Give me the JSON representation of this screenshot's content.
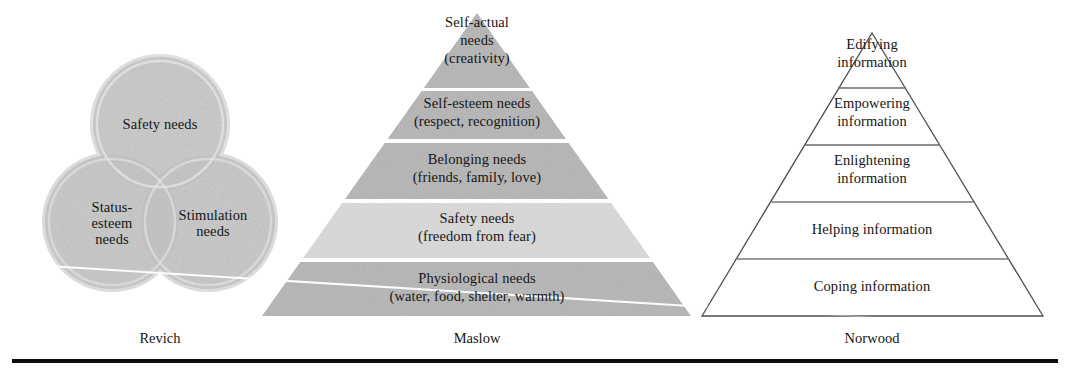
{
  "figure": {
    "background_color": "#ffffff",
    "rule_color": "#0d0d0d",
    "text_color": "#161616"
  },
  "colors": {
    "band_dark": "#a9a9a9",
    "band_light": "#d2d2d2",
    "circle_fill": "#b9b9b9",
    "circle_rim": "#cfcfcf",
    "outline_dark": "#555555",
    "outline_light": "#8a8a8a",
    "separator_white": "#ffffff"
  },
  "models": [
    {
      "id": "revich",
      "caption": "Revich",
      "type": "venn-circles",
      "circles": [
        {
          "id": "safety",
          "label": "Safety needs",
          "cx": 160,
          "cy": 124,
          "r": 67
        },
        {
          "id": "status-esteem",
          "label": "Status-\nesteem\nneeds",
          "cx": 112,
          "cy": 222,
          "r": 67
        },
        {
          "id": "stimulation",
          "label": "Stimulation\nneeds",
          "cx": 208,
          "cy": 222,
          "r": 67
        }
      ]
    },
    {
      "id": "maslow",
      "caption": "Maslow",
      "type": "filled-pyramid",
      "apex": {
        "x": 477,
        "y": 13
      },
      "base": {
        "left_x": 262,
        "right_x": 691,
        "y": 316
      },
      "levels": [
        {
          "rank": 5,
          "line1": "Self-actual",
          "line2": "needs",
          "line3": "(creativity)",
          "shade": "dark",
          "top_y": 13,
          "bottom_y": 88
        },
        {
          "rank": 4,
          "line1": "Self-esteem needs",
          "line2": "(respect, recognition)",
          "line3": "",
          "shade": "dark",
          "top_y": 91,
          "bottom_y": 139
        },
        {
          "rank": 3,
          "line1": "Belonging needs",
          "line2": "(friends, family, love)",
          "line3": "",
          "shade": "dark",
          "top_y": 143,
          "bottom_y": 199
        },
        {
          "rank": 2,
          "line1": "Safety needs",
          "line2": "(freedom from fear)",
          "line3": "",
          "shade": "light",
          "top_y": 203,
          "bottom_y": 258
        },
        {
          "rank": 1,
          "line1": "Physiological needs",
          "line2": "(water, food, shelter, warmth)",
          "line3": "",
          "shade": "dark",
          "top_y": 262,
          "bottom_y": 316
        }
      ]
    },
    {
      "id": "norwood",
      "caption": "Norwood",
      "type": "outline-pyramid",
      "apex": {
        "x": 872,
        "y": 33
      },
      "base": {
        "left_x": 702,
        "right_x": 1043,
        "y": 316
      },
      "levels": [
        {
          "rank": 5,
          "line1": "Edifying",
          "line2": "information",
          "top_y": 33,
          "bottom_y": 88
        },
        {
          "rank": 4,
          "line1": "Empowering",
          "line2": "information",
          "top_y": 88,
          "bottom_y": 145
        },
        {
          "rank": 3,
          "line1": "Enlightening",
          "line2": "information",
          "top_y": 145,
          "bottom_y": 202
        },
        {
          "rank": 2,
          "line1": "Helping information",
          "line2": "",
          "top_y": 202,
          "bottom_y": 259
        },
        {
          "rank": 1,
          "line1": "Coping information",
          "line2": "",
          "top_y": 259,
          "bottom_y": 316
        }
      ]
    }
  ],
  "captions": {
    "revich": "Revich",
    "maslow": "Maslow",
    "norwood": "Norwood"
  },
  "labels": {
    "revich_safety": "Safety needs",
    "revich_status": "Status-\nesteem\nneeds",
    "revich_stimulation": "Stimulation\nneeds",
    "maslow_l5_a": "Self-actual",
    "maslow_l5_b": "needs",
    "maslow_l5_c": "(creativity)",
    "maslow_l4_a": "Self-esteem needs",
    "maslow_l4_b": "(respect, recognition)",
    "maslow_l3_a": "Belonging needs",
    "maslow_l3_b": "(friends, family, love)",
    "maslow_l2_a": "Safety needs",
    "maslow_l2_b": "(freedom from fear)",
    "maslow_l1_a": "Physiological needs",
    "maslow_l1_b": "(water, food, shelter, warmth)",
    "norwood_l5_a": "Edifying",
    "norwood_l5_b": "information",
    "norwood_l4_a": "Empowering",
    "norwood_l4_b": "information",
    "norwood_l3_a": "Enlightening",
    "norwood_l3_b": "information",
    "norwood_l2_a": "Helping information",
    "norwood_l1_a": "Coping information"
  }
}
